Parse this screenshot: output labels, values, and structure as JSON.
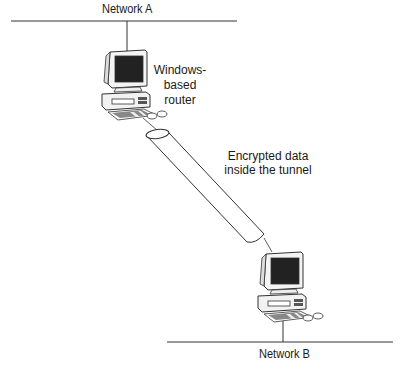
{
  "diagram": {
    "type": "network-tunnel",
    "networks": [
      {
        "id": "network-a",
        "label": "Network A"
      },
      {
        "id": "network-b",
        "label": "Network B"
      }
    ],
    "nodes": [
      {
        "id": "router-a",
        "label_lines": [
          "Windows-",
          "based",
          "router"
        ]
      },
      {
        "id": "router-b",
        "label_lines": []
      }
    ],
    "tunnel": {
      "label_lines": [
        "Encrypted data",
        "inside the tunnel"
      ]
    },
    "colors": {
      "line": "#333333",
      "screen": "#222222",
      "background": "#ffffff"
    }
  }
}
